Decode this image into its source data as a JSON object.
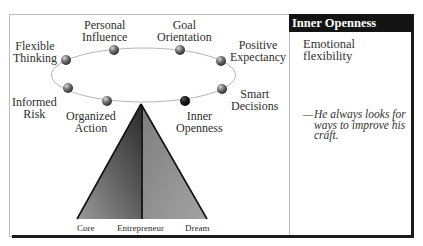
{
  "diagram": {
    "cycle_items": [
      {
        "label_line1": "Flexible",
        "label_line2": "Thinking",
        "highlighted": false
      },
      {
        "label_line1": "Personal",
        "label_line2": "Influence",
        "highlighted": false
      },
      {
        "label_line1": "Goal",
        "label_line2": "Orientation",
        "highlighted": false
      },
      {
        "label_line1": "Positive",
        "label_line2": "Expectancy",
        "highlighted": false
      },
      {
        "label_line1": "Smart",
        "label_line2": "Decisions",
        "highlighted": false
      },
      {
        "label_line1": "Inner",
        "label_line2": "Openness",
        "highlighted": true
      },
      {
        "label_line1": "Organized",
        "label_line2": "Action",
        "highlighted": false
      },
      {
        "label_line1": "Informed",
        "label_line2": "Risk",
        "highlighted": false
      }
    ],
    "pyramid_labels": {
      "left": "Core",
      "center": "Entrepreneur",
      "right": "Dream"
    },
    "colors": {
      "sphere": "#6e6e6e",
      "sphere_highlight": "#111111",
      "pyramid_left": "#4a4a4a",
      "pyramid_right": "#8c8c8c",
      "ellipse": "#b5b5b5"
    }
  },
  "panel": {
    "title": "Inner Openness",
    "subtitle": "Emotional flexibility",
    "quote_dash": "—",
    "quote": "He always looks for ways to improve his craft."
  }
}
